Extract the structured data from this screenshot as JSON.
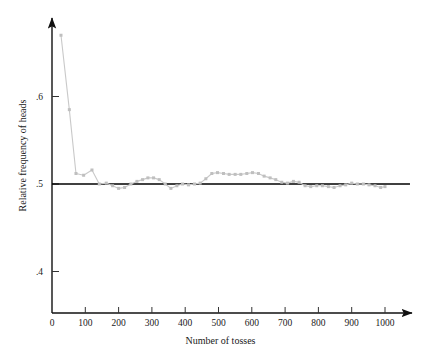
{
  "figure": {
    "background_color": "#ffffff",
    "axis_color": "#111111",
    "reference_line_color": "#000000",
    "data_color": "#c9c9c9",
    "marker_color": "#bfbfbf"
  },
  "chart_data": {
    "type": "line",
    "title": "",
    "xlabel": "Number of tosses",
    "ylabel": "Relative frequency of heads",
    "xlim": [
      0,
      1030
    ],
    "ylim": [
      0.355,
      0.695
    ],
    "grid": false,
    "legend": null,
    "xticks": [
      0,
      100,
      200,
      300,
      400,
      500,
      600,
      700,
      800,
      900,
      1000
    ],
    "xticklabels": [
      "0",
      "100",
      "200",
      "300",
      "400",
      "500",
      "600",
      "700",
      "800",
      "900",
      "1000"
    ],
    "yticks": [
      0.4,
      0.5,
      0.6
    ],
    "yticklabels": [
      ".4",
      ".5",
      ".6"
    ],
    "reference_line": {
      "label": "0.5 reference",
      "y": 0.5,
      "x_start": 0,
      "x_end": 1075
    },
    "series": [
      {
        "name": "Relative frequency of heads",
        "markers": true,
        "x": [
          27,
          52,
          72,
          95,
          120,
          142,
          163,
          182,
          200,
          218,
          237,
          255,
          272,
          288,
          305,
          322,
          340,
          357,
          375,
          392,
          410,
          428,
          445,
          462,
          480,
          497,
          515,
          532,
          550,
          567,
          585,
          602,
          620,
          637,
          655,
          672,
          690,
          707,
          725,
          742,
          760,
          777,
          795,
          812,
          830,
          847,
          865,
          882,
          900,
          917,
          935,
          952,
          970,
          987,
          1000
        ],
        "y": [
          0.67,
          0.585,
          0.512,
          0.51,
          0.516,
          0.5,
          0.501,
          0.498,
          0.495,
          0.496,
          0.5,
          0.503,
          0.505,
          0.507,
          0.507,
          0.505,
          0.5,
          0.495,
          0.498,
          0.5,
          0.499,
          0.5,
          0.501,
          0.506,
          0.512,
          0.513,
          0.512,
          0.511,
          0.511,
          0.511,
          0.512,
          0.513,
          0.512,
          0.509,
          0.507,
          0.505,
          0.502,
          0.501,
          0.503,
          0.502,
          0.498,
          0.497,
          0.498,
          0.498,
          0.497,
          0.496,
          0.498,
          0.499,
          0.501,
          0.5,
          0.5,
          0.499,
          0.498,
          0.496,
          0.497
        ]
      }
    ]
  }
}
